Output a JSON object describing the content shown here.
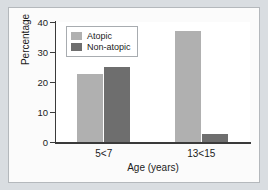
{
  "chart_data": {
    "type": "bar",
    "title": "",
    "subtitle": "",
    "xlabel": "Age (years)",
    "ylabel": "Percentage",
    "categories": [
      "5<7",
      "13<15"
    ],
    "series": [
      {
        "name": "Atopic",
        "values": [
          22.7,
          37.0
        ],
        "color": "#b0b0b0"
      },
      {
        "name": "Non-atopic",
        "values": [
          25.0,
          2.7
        ],
        "color": "#6e6e6e"
      }
    ],
    "ylim": [
      0,
      40
    ],
    "yticks": [
      0,
      10,
      20,
      30,
      40
    ],
    "ytick_labels": [
      "0",
      "10",
      "20",
      "30",
      "40"
    ],
    "xtick_labels": [
      "5<7",
      "13<15"
    ],
    "grid": false,
    "legend": {
      "position": "upper-left-inside",
      "entries": [
        "Atopic",
        "Non-atopic"
      ]
    }
  },
  "figure": {
    "background_color": "#d9dde1",
    "panel_color": "#fbfbfb",
    "plot_area_color": "#ffffff",
    "axis_color": "#3a3a3a"
  }
}
